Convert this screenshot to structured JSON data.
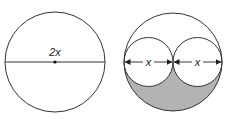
{
  "figures": {
    "left": {
      "label": "2x",
      "description": "circle with diameter 2x"
    },
    "right": {
      "label_left": "x",
      "label_right": "x",
      "description": "large circle containing two tangent circles of diameter x; lower region shaded"
    }
  },
  "colors": {
    "stroke": "#333333",
    "shade": "#b3b3b3",
    "background": "#ffffff"
  }
}
